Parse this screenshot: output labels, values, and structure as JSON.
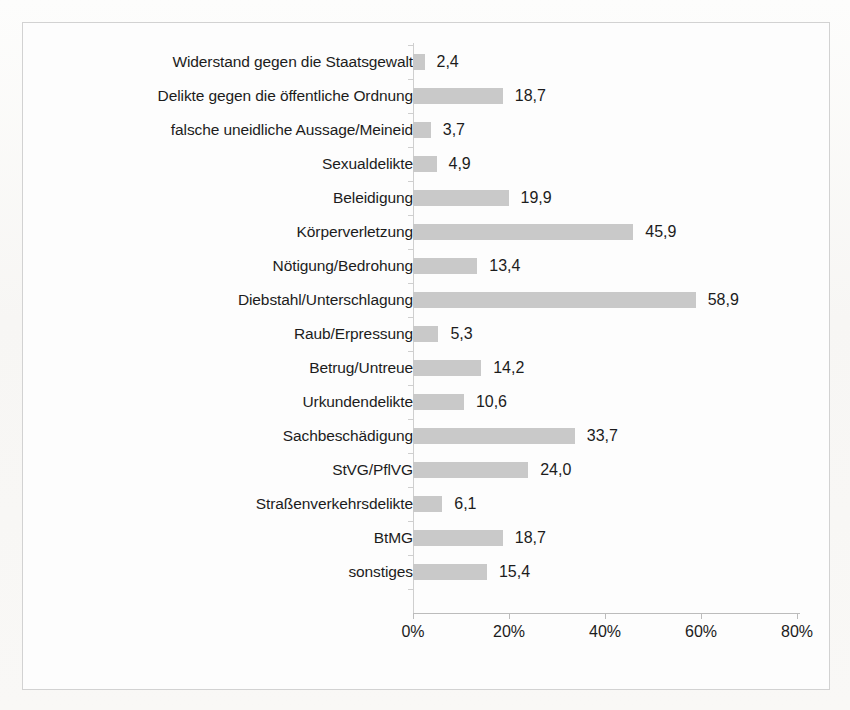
{
  "chart_data": {
    "type": "bar",
    "orientation": "horizontal",
    "title": "",
    "subtitle": "",
    "xlabel": "",
    "ylabel": "",
    "xlim": [
      0,
      80
    ],
    "xticks": [
      0,
      20,
      40,
      60,
      80
    ],
    "xtick_labels": [
      "0%",
      "20%",
      "40%",
      "60%",
      "80%"
    ],
    "grid": false,
    "legend": null,
    "value_format": "german-decimal-comma",
    "bar_color": "#c9c9c9",
    "text_color": "#1c1c1c",
    "axis_color": "#bcbcbc",
    "frame_color": "#d2d2d2",
    "background_color": "#fdfdfd",
    "categories": [
      "Widerstand gegen die Staatsgewalt",
      "Delikte gegen die öffentliche Ordnung",
      "falsche uneidliche Aussage/Meineid",
      "Sexualdelikte",
      "Beleidigung",
      "Körperverletzung",
      "Nötigung/Bedrohung",
      "Diebstahl/Unterschlagung",
      "Raub/Erpressung",
      "Betrug/Untreue",
      "Urkundendelikte",
      "Sachbeschädigung",
      "StVG/PflVG",
      "Straßenverkehrsdelikte",
      "BtMG",
      "sonstiges"
    ],
    "values": [
      2.4,
      18.7,
      3.7,
      4.9,
      19.9,
      45.9,
      13.4,
      58.9,
      5.3,
      14.2,
      10.6,
      33.7,
      24.0,
      6.1,
      18.7,
      15.4
    ],
    "value_labels": [
      "2,4",
      "18,7",
      "3,7",
      "4,9",
      "19,9",
      "45,9",
      "13,4",
      "58,9",
      "5,3",
      "14,2",
      "10,6",
      "33,7",
      "24,0",
      "6,1",
      "18,7",
      "15,4"
    ]
  }
}
